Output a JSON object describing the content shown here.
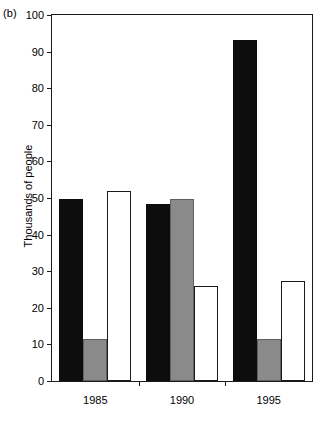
{
  "panel": {
    "label": "(b)"
  },
  "chart_data": {
    "type": "bar",
    "title": "",
    "subtitle": "",
    "panel_label": "(b)",
    "xlabel": "",
    "ylabel": "Thousands of people",
    "categories": [
      "1985",
      "1990",
      "1995"
    ],
    "series": [
      {
        "name": "series-1",
        "style": "black",
        "color": "#0d0d0d",
        "values": [
          49.7,
          48.3,
          93.3
        ]
      },
      {
        "name": "series-2",
        "style": "gray",
        "color": "#8a8a8a",
        "values": [
          11.5,
          49.7,
          11.5
        ]
      },
      {
        "name": "series-3",
        "style": "white",
        "color": "#ffffff",
        "values": [
          52.0,
          26.0,
          27.3
        ]
      }
    ],
    "ylim": [
      0,
      100
    ],
    "ytick_values": [
      0,
      10,
      20,
      30,
      40,
      50,
      60,
      70,
      80,
      90,
      100
    ],
    "ytick_labels": [
      "0",
      "10",
      "20",
      "30",
      "40",
      "50",
      "60",
      "70",
      "80",
      "90",
      "100"
    ],
    "xtick_labels": [
      "1985",
      "1990",
      "1995"
    ],
    "grid": false,
    "legend": "none",
    "frame": "box",
    "bar_grouping": "clustered-touching"
  },
  "colors": {
    "axis": "#1a1a1a",
    "black_bar": "#0d0d0d",
    "gray_bar": "#8a8a8a",
    "white_bar": "#ffffff",
    "background": "#ffffff"
  }
}
